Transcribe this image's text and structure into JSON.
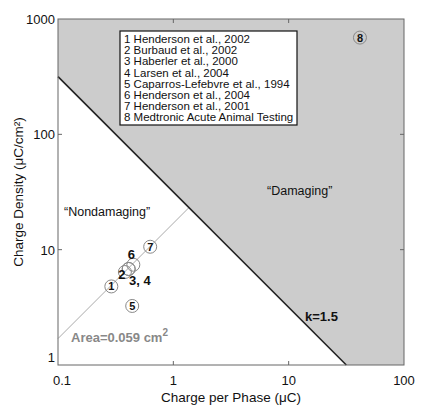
{
  "chart_data": {
    "type": "scatter",
    "title": "",
    "xlabel": "Charge per Phase (μC)",
    "ylabel": "Charge Density (μC/cm²)",
    "xscale": "log",
    "yscale": "log",
    "xlim": [
      0.1,
      100
    ],
    "ylim": [
      1,
      1000
    ],
    "xticks": [
      "0.1",
      "1",
      "10",
      "100"
    ],
    "yticks": [
      "1",
      "10",
      "100",
      "1000"
    ],
    "grid": false,
    "legend_position": "upper-left inside (inset box)",
    "legend": [
      "1 Henderson et al., 2002",
      "2 Burbaud et al., 2002",
      "3 Haberler et al., 2000",
      "4 Larsen et al., 2004",
      "5 Caparros-Lefebvre et al., 1994",
      "6 Henderson et al., 2004",
      "7 Henderson et al., 2001",
      "8 Medtronic Acute Animal Testing"
    ],
    "points": [
      {
        "id": "1",
        "x": 0.29,
        "y": 4.8
      },
      {
        "id": "2",
        "x": 0.38,
        "y": 6.4
      },
      {
        "id": "3",
        "x": 0.41,
        "y": 6.8
      },
      {
        "id": "4",
        "x": 0.41,
        "y": 6.8
      },
      {
        "id": "5",
        "x": 0.44,
        "y": 3.25
      },
      {
        "id": "6",
        "x": 0.45,
        "y": 7.4
      },
      {
        "id": "7",
        "x": 0.63,
        "y": 10.6
      },
      {
        "id": "8",
        "x": 41.5,
        "y": 690
      }
    ],
    "lines": [
      {
        "name": "k=1.5",
        "description": "Shannon limit: log(D) = k - log(Q), D = 10^1.5 / Q",
        "k": 1.5,
        "color": "#222222"
      },
      {
        "name": "Area=0.059 cm²",
        "description": "D = Q / 0.059",
        "area_cm2": 0.059,
        "color": "#aaaaaa"
      }
    ],
    "regions": [
      {
        "label": "“Damaging”",
        "fill": "#cccccc",
        "where": "above k=1.5 line"
      },
      {
        "label": "“Nondamaging”",
        "fill": "#ffffff",
        "where": "below k=1.5 line"
      }
    ],
    "annotations": [
      "“Nondamaging”",
      "“Damaging”",
      "k=1.5",
      "Area=0.059 cm²",
      "3, 4"
    ]
  },
  "labels": {
    "xlabel": "Charge per Phase (μC)",
    "ylabel": "Charge Density (μC/cm²)",
    "nondamaging": "“Nondamaging”",
    "damaging": "“Damaging”",
    "k": "k=1.5",
    "area_prefix": "Area=0.059 cm",
    "area_sup": "2",
    "pt34": "3, 4"
  },
  "colors": {
    "damaging_fill": "#cccccc",
    "k_line": "#222222",
    "area_line": "#aaaaaa",
    "area_text": "#888888",
    "axis": "#666666"
  }
}
